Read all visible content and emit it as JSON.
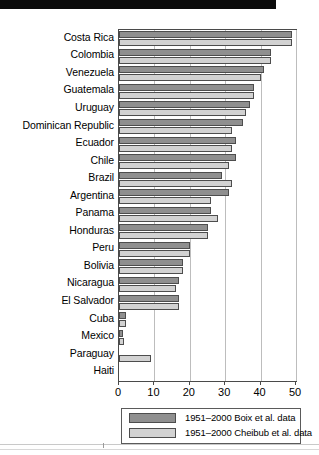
{
  "chart_data": {
    "type": "bar",
    "orientation": "horizontal",
    "title": "",
    "subtitle": "",
    "xlabel": "",
    "ylabel": "",
    "xlim": [
      0,
      50
    ],
    "xticks": [
      0,
      10,
      20,
      30,
      40,
      50
    ],
    "xtick_labels": [
      "0",
      "10",
      "20",
      "30",
      "40",
      "50"
    ],
    "grid": "vertical",
    "legend_position": "bottom",
    "categories": [
      "Costa Rica",
      "Colombia",
      "Venezuela",
      "Guatemala",
      "Uruguay",
      "Dominican Republic",
      "Ecuador",
      "Chile",
      "Brazil",
      "Argentina",
      "Panama",
      "Honduras",
      "Peru",
      "Bolivia",
      "Nicaragua",
      "El Salvador",
      "Cuba",
      "Mexico",
      "Paraguay",
      "Haiti"
    ],
    "series": [
      {
        "name": "1951–2000 Boix et al. data",
        "color": "#8f8f8f",
        "values": [
          49,
          43,
          41,
          38,
          37,
          35,
          33,
          33,
          29,
          31,
          26,
          25,
          20,
          18,
          17,
          17,
          2,
          1,
          0,
          0
        ]
      },
      {
        "name": "1951–2000 Cheibub et al. data",
        "color": "#d2d2d2",
        "values": [
          49,
          43,
          40,
          38,
          36,
          32,
          32,
          31,
          32,
          26,
          28,
          25,
          20,
          18,
          16,
          17,
          2,
          1.5,
          9,
          0
        ]
      }
    ],
    "legend": [
      "1951–2000 Boix et al. data",
      "1951–2000 Cheibub et al. data"
    ]
  }
}
